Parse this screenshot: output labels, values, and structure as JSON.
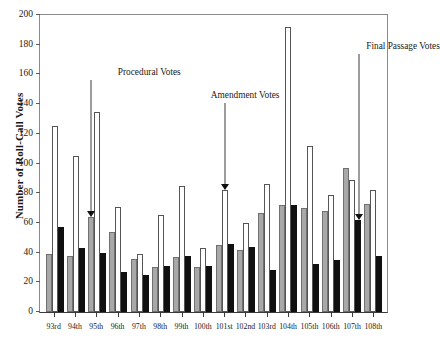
{
  "chart_data": {
    "type": "bar",
    "title": "",
    "xlabel": "",
    "ylabel": "Number of Roll-Call Votes",
    "ylim": [
      0,
      200
    ],
    "yticks": [
      0,
      20,
      40,
      60,
      80,
      100,
      120,
      140,
      160,
      180,
      200
    ],
    "grid": false,
    "legend_position": "none",
    "categories": [
      "93rd",
      "94th",
      "95th",
      "96th",
      "97th",
      "98th",
      "99th",
      "100th",
      "101st",
      "102nd",
      "103rd",
      "104th",
      "105th",
      "106th",
      "107th",
      "108th"
    ],
    "series": [
      {
        "name": "Procedural Votes",
        "color": "#a8a8a8",
        "values": [
          39,
          38,
          64,
          54,
          36,
          30,
          37,
          30,
          45,
          42,
          67,
          72,
          70,
          68,
          97,
          73
        ]
      },
      {
        "name": "Amendment Votes",
        "color": "#ffffff",
        "values": [
          125,
          105,
          135,
          71,
          39,
          65,
          85,
          43,
          82,
          60,
          86,
          192,
          112,
          79,
          89,
          82
        ]
      },
      {
        "name": "Final Passage Votes",
        "color": "#101010",
        "values": [
          57,
          43,
          40,
          27,
          25,
          31,
          38,
          31,
          46,
          44,
          28,
          72,
          32,
          35,
          62,
          38
        ]
      }
    ],
    "annotations": [
      {
        "label": "Procedural Votes",
        "target_category": "95th",
        "target_series": "Procedural Votes",
        "target_value": 64
      },
      {
        "label": "Amendment Votes",
        "target_category": "101st",
        "target_series": "Amendment Votes",
        "target_value": 82
      },
      {
        "label": "Final Passage Votes",
        "target_category": "107th",
        "target_series": "Final Passage Votes",
        "target_value": 62
      }
    ]
  }
}
